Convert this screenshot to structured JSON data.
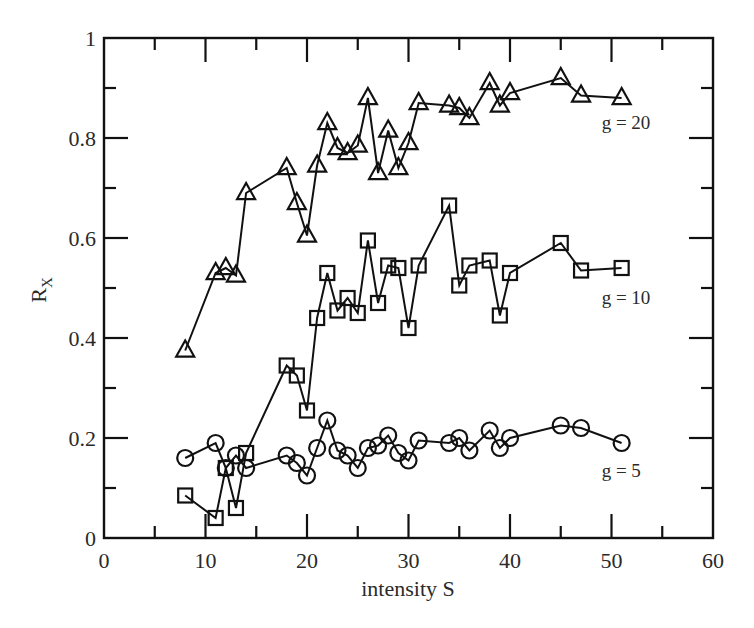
{
  "chart_data": {
    "type": "line",
    "title": "",
    "xlabel": "intensity S",
    "ylabel": "R",
    "ylabel_subscript": "X",
    "xlim": [
      0,
      60
    ],
    "ylim": [
      0,
      1
    ],
    "grid": false,
    "legend": "inline labels at right end of each series",
    "x_ticks": [
      0,
      10,
      20,
      30,
      40,
      50,
      60
    ],
    "x_tick_labels": [
      "0",
      "10",
      "20",
      "30",
      "40",
      "50",
      "60"
    ],
    "x_minor_ticks": [
      5,
      15,
      25,
      35,
      45,
      55
    ],
    "y_ticks": [
      0,
      0.2,
      0.4,
      0.6,
      0.8,
      1
    ],
    "y_tick_labels": [
      "0",
      "0.2",
      "0.4",
      "0.6",
      "0.8",
      "1"
    ],
    "y_minor_ticks": [
      0.1,
      0.3,
      0.5,
      0.7,
      0.9
    ],
    "series": [
      {
        "name": "g = 20",
        "marker": "triangle",
        "label_pos": [
          51,
          0.83
        ],
        "x": [
          8,
          11,
          12,
          13,
          14,
          18,
          19,
          20,
          21,
          22,
          23,
          24,
          25,
          26,
          27,
          28,
          29,
          30,
          31,
          34,
          35,
          36,
          38,
          39,
          40,
          45,
          47,
          51
        ],
        "y": [
          0.375,
          0.53,
          0.54,
          0.525,
          0.69,
          0.74,
          0.67,
          0.605,
          0.745,
          0.83,
          0.78,
          0.77,
          0.785,
          0.88,
          0.73,
          0.815,
          0.74,
          0.79,
          0.87,
          0.865,
          0.86,
          0.84,
          0.91,
          0.865,
          0.89,
          0.92,
          0.885,
          0.88
        ]
      },
      {
        "name": "g = 10",
        "marker": "square",
        "label_pos": [
          51,
          0.48
        ],
        "x": [
          8,
          11,
          12,
          13,
          14,
          18,
          19,
          20,
          21,
          22,
          23,
          24,
          25,
          26,
          27,
          28,
          29,
          30,
          31,
          34,
          35,
          36,
          38,
          39,
          40,
          45,
          47,
          51
        ],
        "y": [
          0.085,
          0.04,
          0.14,
          0.06,
          0.17,
          0.345,
          0.325,
          0.255,
          0.44,
          0.53,
          0.455,
          0.48,
          0.45,
          0.595,
          0.47,
          0.545,
          0.54,
          0.42,
          0.545,
          0.665,
          0.505,
          0.545,
          0.555,
          0.445,
          0.53,
          0.59,
          0.535,
          0.54
        ]
      },
      {
        "name": "g = 5",
        "marker": "circle",
        "label_pos": [
          51,
          0.135
        ],
        "x": [
          8,
          11,
          12,
          13,
          14,
          18,
          19,
          20,
          21,
          22,
          23,
          24,
          25,
          26,
          27,
          28,
          29,
          30,
          31,
          34,
          35,
          36,
          38,
          39,
          40,
          45,
          47,
          51
        ],
        "y": [
          0.16,
          0.19,
          0.14,
          0.165,
          0.14,
          0.165,
          0.15,
          0.125,
          0.18,
          0.235,
          0.175,
          0.165,
          0.14,
          0.18,
          0.185,
          0.205,
          0.17,
          0.155,
          0.195,
          0.19,
          0.2,
          0.175,
          0.215,
          0.18,
          0.2,
          0.225,
          0.22,
          0.19
        ]
      }
    ]
  }
}
